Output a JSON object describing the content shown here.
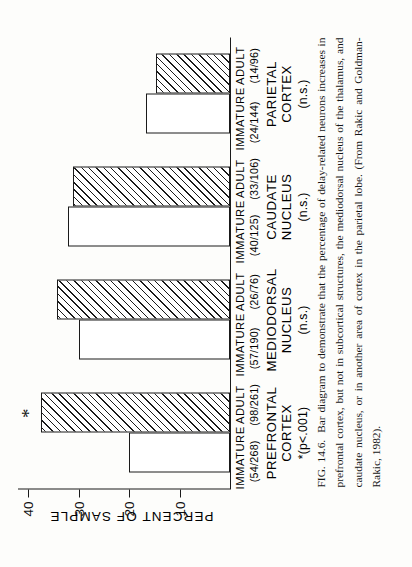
{
  "figure": {
    "number": "FIG. 14.6.",
    "caption": "Bar diagram to demonstrate that the percentage of delay-related neurons increases in prefrontal cortex, but not in subcortical structures, the mediodorsal nucleus of the thalamus, and caudate nucleus, or in another area of cortex in the parietal lobe. (From Rakic and Goldman-Rakic, 1982).",
    "orientation": "rotated-90-ccw"
  },
  "chart_data": {
    "type": "bar",
    "title": "",
    "xlabel": "",
    "ylabel": "PERCENT OF SAMPLE",
    "ylim": [
      0,
      42
    ],
    "yticks": [
      10,
      20,
      30,
      40
    ],
    "ytick_labels": [
      "10",
      "20",
      "30",
      "40"
    ],
    "grid": false,
    "legend": "inline-per-bar",
    "categories": [
      "PREFRONTAL CORTEX",
      "MEDIODORSAL NUCLEUS",
      "CAUDATE NUCLEUS",
      "PARIETAL CORTEX"
    ],
    "series": [
      {
        "name": "IMMATURE",
        "values": [
          20.1,
          30.0,
          32.0,
          16.7
        ]
      },
      {
        "name": "ADULT",
        "values": [
          37.5,
          34.2,
          31.1,
          14.6
        ]
      }
    ],
    "annotations": [
      {
        "category": "PREFRONTAL CORTEX",
        "series": "ADULT",
        "text": "*"
      }
    ]
  },
  "axis": {
    "y_title": "PERCENT OF SAMPLE",
    "ticks": [
      {
        "value": 40,
        "label": "40"
      },
      {
        "value": 30,
        "label": "30"
      },
      {
        "value": 20,
        "label": "20"
      },
      {
        "value": 10,
        "label": "10"
      }
    ]
  },
  "groups": [
    {
      "id": "prefrontal-cortex",
      "name_line1": "PREFRONTAL",
      "name_line2": "CORTEX",
      "significance": "*(p<.001)",
      "bars": [
        {
          "series": "IMMATURE",
          "label": "IMMATURE",
          "fraction": "(54/268)",
          "value": 20.1,
          "style": "open",
          "star": ""
        },
        {
          "series": "ADULT",
          "label": "ADULT",
          "fraction": "(98/261)",
          "value": 37.5,
          "style": "hatched",
          "star": "*"
        }
      ]
    },
    {
      "id": "mediodorsal-nucleus",
      "name_line1": "MEDIODORSAL",
      "name_line2": "NUCLEUS",
      "significance": "(n.s.)",
      "bars": [
        {
          "series": "IMMATURE",
          "label": "IMMATURE",
          "fraction": "(57/190)",
          "value": 30.0,
          "style": "open",
          "star": ""
        },
        {
          "series": "ADULT",
          "label": "ADULT",
          "fraction": "(26/76)",
          "value": 34.2,
          "style": "hatched",
          "star": ""
        }
      ]
    },
    {
      "id": "caudate-nucleus",
      "name_line1": "CAUDATE",
      "name_line2": "NUCLEUS",
      "significance": "(n.s.)",
      "bars": [
        {
          "series": "IMMATURE",
          "label": "IMMATURE",
          "fraction": "(40/125)",
          "value": 32.0,
          "style": "open",
          "star": ""
        },
        {
          "series": "ADULT",
          "label": "ADULT",
          "fraction": "(33/106)",
          "value": 31.1,
          "style": "hatched",
          "star": ""
        }
      ]
    },
    {
      "id": "parietal-cortex",
      "name_line1": "PARIETAL",
      "name_line2": "CORTEX",
      "significance": "(n.s.)",
      "bars": [
        {
          "series": "IMMATURE",
          "label": "IMMATURE",
          "fraction": "(24/144)",
          "value": 16.7,
          "style": "open",
          "star": ""
        },
        {
          "series": "ADULT",
          "label": "ADULT",
          "fraction": "(14/96)",
          "value": 14.6,
          "style": "hatched",
          "star": ""
        }
      ]
    }
  ]
}
